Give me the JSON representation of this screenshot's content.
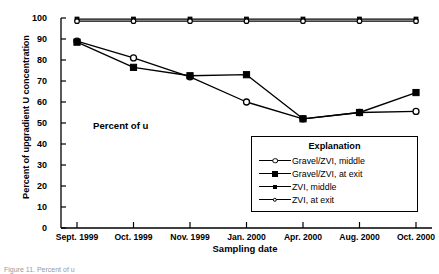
{
  "figure": {
    "annotation": "Percent of u",
    "caption": "Figure 11. Percent of u"
  },
  "legend": {
    "title": "Explanation",
    "entries": [
      {
        "label": "Gravel/ZVI, middle",
        "marker": "open-circle"
      },
      {
        "label": "Gravel/ZVI, at exit",
        "marker": "filled-square"
      },
      {
        "label": "ZVI, middle",
        "marker": "filled-small"
      },
      {
        "label": "ZVI, at exit",
        "marker": "open-small"
      }
    ]
  },
  "axes": {
    "ylabel": "Percent of upgradient U concentration",
    "xlabel": "Sampling date",
    "yticks": [
      "0",
      "10",
      "20",
      "30",
      "40",
      "50",
      "60",
      "70",
      "80",
      "90",
      "100"
    ]
  },
  "chart_data": {
    "type": "line",
    "title": "",
    "xlabel": "Sampling date",
    "ylabel": "Percent of upgradient U concentration",
    "categories": [
      "Sept. 1999",
      "Oct. 1999",
      "Nov. 1999",
      "Jan. 2000",
      "Apr. 2000",
      "Aug. 2000",
      "Oct. 2000"
    ],
    "ylim": [
      0,
      100
    ],
    "yticks": [
      0,
      10,
      20,
      30,
      40,
      50,
      60,
      70,
      80,
      90,
      100
    ],
    "grid": false,
    "legend_position": "lower-right",
    "annotations": [
      {
        "text": "Percent of u",
        "x": "Nov. 1999",
        "y": 43
      }
    ],
    "series": [
      {
        "name": "ZVI, middle",
        "marker": "filled-small",
        "values": [
          99.5,
          99.5,
          99.5,
          99.5,
          99.5,
          99.5,
          99.5
        ]
      },
      {
        "name": "ZVI, at exit",
        "marker": "open-small",
        "values": [
          98.5,
          98.5,
          98.5,
          98.5,
          98.5,
          98.5,
          98.5
        ]
      },
      {
        "name": "Gravel/ZVI, middle",
        "marker": "open-circle",
        "values": [
          89,
          81,
          72,
          60,
          52,
          55,
          55.5
        ]
      },
      {
        "name": "Gravel/ZVI, at exit",
        "marker": "filled-square",
        "values": [
          88.5,
          76.5,
          72.5,
          73,
          52,
          55,
          64.5
        ]
      }
    ]
  }
}
